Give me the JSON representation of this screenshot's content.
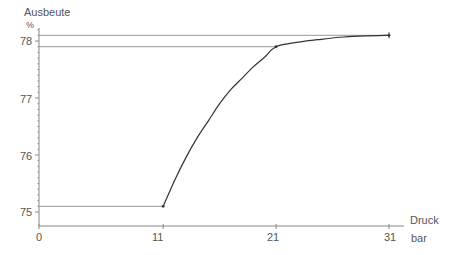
{
  "chart_data": {
    "type": "line",
    "title": "",
    "ylabel": "Ausbeute",
    "yunit": "%",
    "xlabel": "Druck",
    "xunit": "bar",
    "xlim": [
      0,
      31
    ],
    "ylim": [
      75,
      78
    ],
    "x_ticks": [
      0,
      11,
      21,
      31
    ],
    "y_ticks": [
      75,
      76,
      77,
      78
    ],
    "grid": false,
    "legend": null,
    "series": [
      {
        "name": "Ausbeute",
        "x": [
          0,
          11,
          12,
          13,
          14,
          15,
          16,
          17,
          18,
          19,
          20,
          21,
          23,
          25,
          27,
          29,
          31
        ],
        "y": [
          75.1,
          75.1,
          75.55,
          75.95,
          76.3,
          76.6,
          76.9,
          77.15,
          77.35,
          77.55,
          77.72,
          77.9,
          77.98,
          78.03,
          78.07,
          78.09,
          78.1
        ]
      }
    ],
    "reference_lines": [
      {
        "axis": "y",
        "value": 78.1,
        "from_x": 0,
        "to_x": 31
      },
      {
        "axis": "y",
        "value": 77.9,
        "from_x": 0,
        "to_x": 21
      }
    ],
    "markers": [
      {
        "x": 11,
        "y": 75.1
      },
      {
        "x": 21,
        "y": 77.9
      },
      {
        "x": 31,
        "y": 78.1
      }
    ]
  },
  "labels": {
    "y_title": "Ausbeute",
    "y_unit": "%",
    "x_title": "Druck",
    "x_unit": "bar",
    "x_tick_0": "0",
    "x_tick_1": "11",
    "x_tick_2": "21",
    "x_tick_3": "31",
    "y_tick_0": "75",
    "y_tick_1": "76",
    "y_tick_2": "77",
    "y_tick_3": "78"
  },
  "colors": {
    "axis": "#888888",
    "curve": "#333333",
    "reference": "#999999",
    "text": "#555555"
  }
}
